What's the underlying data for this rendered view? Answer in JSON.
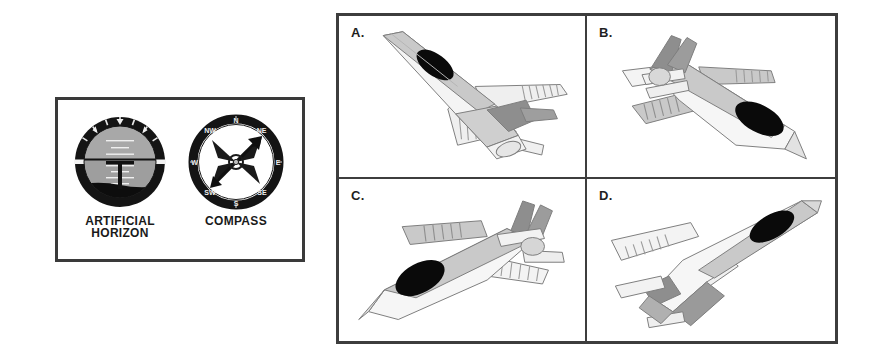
{
  "instrument_panel": {
    "instruments": [
      {
        "id": "artificial-horizon",
        "caption_line1": "ARTIFICIAL",
        "caption_line2": "HORIZON",
        "type": "attitude-indicator",
        "bezel_color": "#141414",
        "sky_color": "#a8a8a8",
        "ground_color": "#0d0d0d",
        "symbol_color": "#111111",
        "pitch_ladder_color": "#efefef",
        "horizon_bank_degrees": 0,
        "pitch_attitude": "level-nose-on-horizon"
      },
      {
        "id": "compass",
        "caption_line1": "COMPASS",
        "caption_line2": "",
        "type": "magnetic-compass",
        "bezel_color": "#141414",
        "face_color": "#ffffff",
        "needle_color": "#111111",
        "heading_label": "NE",
        "heading_degrees": 45,
        "cardinal_points": [
          "N",
          "NE",
          "E",
          "SE",
          "S",
          "SW",
          "W",
          "NW"
        ]
      }
    ]
  },
  "aircraft_grid": {
    "rows": 2,
    "columns": 2,
    "border_color": "#3d3d3d",
    "cells": [
      {
        "label": "A.",
        "id": "A",
        "orientation": "climbing nose up-left, banked, viewed from above-behind",
        "nose_heading": "upper-left",
        "canopy_color": "#0a0a0a",
        "body_light": "#f2f2f2",
        "body_mid": "#c9c9c9",
        "body_dark": "#9a9a9a",
        "tail_shade": "#8e8e8e"
      },
      {
        "label": "B.",
        "id": "B",
        "orientation": "descending nose down-right, viewed from above",
        "nose_heading": "lower-right",
        "canopy_color": "#0a0a0a",
        "body_light": "#f2f2f2",
        "body_mid": "#c9c9c9",
        "body_dark": "#9a9a9a",
        "tail_shade": "#8e8e8e"
      },
      {
        "label": "C.",
        "id": "C",
        "orientation": "descending nose down-left, viewed from above",
        "nose_heading": "lower-left",
        "canopy_color": "#0a0a0a",
        "body_light": "#f2f2f2",
        "body_mid": "#c9c9c9",
        "body_dark": "#9a9a9a",
        "tail_shade": "#8e8e8e"
      },
      {
        "label": "D.",
        "id": "D",
        "orientation": "climbing nose up-right, banked, viewed from above-behind",
        "nose_heading": "upper-right",
        "canopy_color": "#0a0a0a",
        "body_light": "#f2f2f2",
        "body_mid": "#c9c9c9",
        "body_dark": "#9a9a9a",
        "tail_shade": "#8e8e8e"
      }
    ]
  },
  "page": {
    "background_color": "#ffffff",
    "ink_color": "#1a1a1a"
  }
}
